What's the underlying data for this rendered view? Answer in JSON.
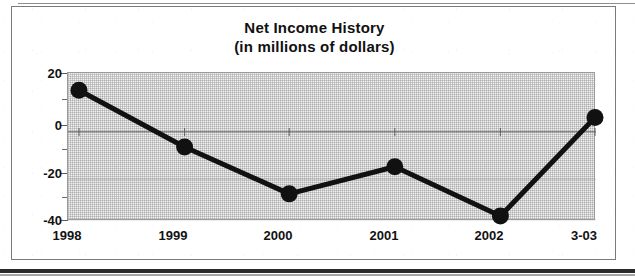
{
  "chart_data": {
    "type": "line",
    "title": "Net Income History",
    "subtitle": "(in millions of dollars)",
    "xlabel": "",
    "ylabel": "",
    "categories": [
      "1998",
      "1999",
      "2000",
      "2001",
      "2002",
      "3-03"
    ],
    "values": [
      13,
      -10,
      -29,
      -18,
      -38,
      2
    ],
    "series": [
      {
        "name": "Net Income",
        "values": [
          13,
          -10,
          -29,
          -18,
          -38,
          2
        ]
      }
    ],
    "ylim": [
      -40,
      20
    ],
    "y_ticks": [
      "20",
      "0",
      "-20",
      "-40"
    ],
    "y_tick_values": [
      20,
      0,
      -20,
      -40
    ],
    "y_minor_tick_values": [
      10,
      -10,
      -30
    ],
    "grid": "horizontal-faint",
    "legend": "none",
    "line_color": "#111111",
    "marker": "circle",
    "marker_color": "#111111",
    "plot_background": "#f1f1f1"
  },
  "figure": {
    "title": "Net Income History",
    "subtitle": "(in millions of dollars)",
    "border_color": "#7b7b7b"
  },
  "axes": {
    "y_labels": [
      "20",
      "0",
      "-20",
      "-40"
    ],
    "x_labels": [
      "1998",
      "1999",
      "2000",
      "2001",
      "2002",
      "3-03"
    ]
  }
}
